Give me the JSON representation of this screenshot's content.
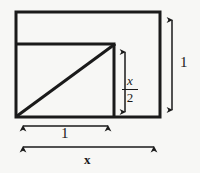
{
  "figure": {
    "background_color": "#f7f7f5",
    "stroke_color": "#1a1a1a",
    "outer_rectangle": {
      "name": "outer-rectangle",
      "x": 16,
      "y": 12,
      "width": 144,
      "height": 105,
      "stroke_width": 3
    },
    "inner_divider_horizontal": {
      "name": "inner-horizontal-divider",
      "x1": 16,
      "y1": 44,
      "x2": 115,
      "y2": 44,
      "stroke_width": 3
    },
    "inner_divider_vertical": {
      "name": "inner-vertical-divider",
      "x1": 115,
      "y1": 44,
      "x2": 115,
      "y2": 117,
      "stroke_width": 3
    },
    "diagonal": {
      "name": "diagonal-line",
      "x1": 16,
      "y1": 117,
      "x2": 115,
      "y2": 44,
      "stroke_width": 3
    }
  },
  "dimensions": {
    "height_right": {
      "name": "height-dimension-arrow",
      "label": "1",
      "orientation": "vertical",
      "x": 172,
      "y_start": 13,
      "y_end": 117
    },
    "width_inner": {
      "name": "inner-width-dimension-arrow",
      "label": "1",
      "orientation": "horizontal",
      "y": 126,
      "x_start": 16,
      "x_end": 114
    },
    "width_outer": {
      "name": "outer-width-dimension-arrow",
      "label": "x",
      "orientation": "horizontal",
      "y": 147,
      "x_start": 16,
      "x_end": 160
    },
    "segment_vertical": {
      "name": "segment-dimension-arrow",
      "label_numerator": "x",
      "label_fraction_bar": "—",
      "label_denominator": "2",
      "label_full": "x/2",
      "orientation": "vertical",
      "x": 125,
      "y_start": 45,
      "y_end": 117
    }
  }
}
